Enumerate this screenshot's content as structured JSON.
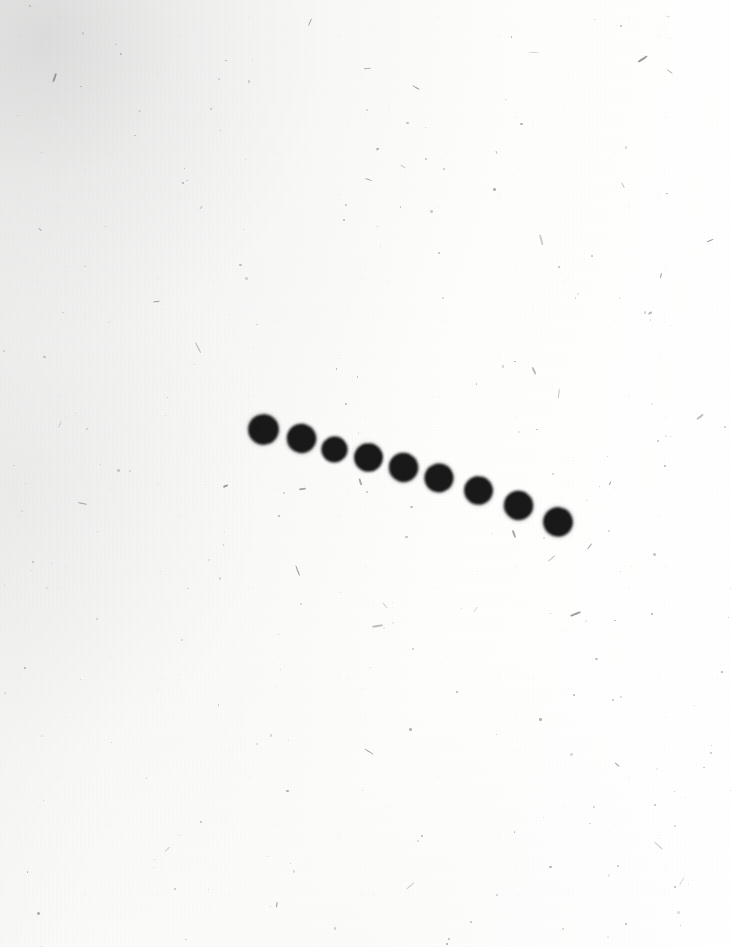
{
  "image": {
    "kind": "scanned-photographic-plate",
    "width": 731,
    "height": 947,
    "background_color": "#fbfbfa",
    "vignette_color": "#efefee",
    "spot_color": "#1e1e1e",
    "spot_halo_color": "#5a5a5a",
    "speck_color": "#8a8a8a",
    "description": "Scanned photographic plate showing a sequence of ten dark round exposures descending left to right in a shallow arc across a speckled off-white field."
  },
  "chart_data": {
    "type": "scatter",
    "title": "",
    "subtitle": "",
    "xlabel": "",
    "ylabel": "",
    "xlim": [
      0,
      731
    ],
    "ylim": [
      947,
      0
    ],
    "grid": false,
    "legend": null,
    "axis_visible": false,
    "tick_labels_x": [],
    "tick_labels_y": [],
    "series": [
      {
        "name": "exposure-sequence",
        "marker": "filled-circle",
        "color": "#1e1e1e",
        "points": [
          {
            "index": 1,
            "x": 263,
            "y": 429,
            "size": 27
          },
          {
            "index": 2,
            "x": 301,
            "y": 438,
            "size": 25
          },
          {
            "index": 3,
            "x": 334,
            "y": 449,
            "size": 23
          },
          {
            "index": 4,
            "x": 368,
            "y": 457,
            "size": 25
          },
          {
            "index": 5,
            "x": 403,
            "y": 467,
            "size": 25
          },
          {
            "index": 6,
            "x": 439,
            "y": 478,
            "size": 26
          },
          {
            "index": 7,
            "x": 478,
            "y": 490,
            "size": 25
          },
          {
            "index": 8,
            "x": 518,
            "y": 505,
            "size": 25
          },
          {
            "index": 9,
            "x": 545,
            "y": 500,
            "size": 0
          },
          {
            "index": 10,
            "x": 558,
            "y": 522,
            "size": 26
          }
        ]
      }
    ],
    "annotations": []
  },
  "texture": {
    "speck_count": 210,
    "fibre_count": 46,
    "seed": 20240517
  }
}
